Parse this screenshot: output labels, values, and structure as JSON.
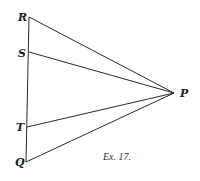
{
  "figure": {
    "caption": "Ex. 17.",
    "points": {
      "R": {
        "label": "R",
        "x": 29,
        "y": 17
      },
      "S": {
        "label": "S",
        "x": 29,
        "y": 52
      },
      "T": {
        "label": "T",
        "x": 27,
        "y": 127
      },
      "Q": {
        "label": "Q",
        "x": 26,
        "y": 162
      },
      "P": {
        "label": "P",
        "x": 174,
        "y": 93
      }
    },
    "segments": [
      [
        "R",
        "Q"
      ],
      [
        "R",
        "P"
      ],
      [
        "S",
        "P"
      ],
      [
        "T",
        "P"
      ],
      [
        "Q",
        "P"
      ]
    ]
  }
}
